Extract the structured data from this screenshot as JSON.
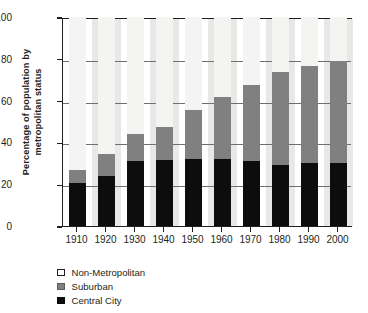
{
  "chart_data": {
    "type": "bar",
    "subtype": "stacked-bar-100",
    "title": "",
    "xlabel": "",
    "ylabel": "Percentage of population by metropolitan status",
    "ylim": [
      0,
      100
    ],
    "yticks": [
      0,
      20,
      40,
      60,
      80,
      100
    ],
    "grid": true,
    "legend_position": "below-left",
    "categories": [
      "1910",
      "1920",
      "1930",
      "1940",
      "1950",
      "1960",
      "1970",
      "1980",
      "1990",
      "2000"
    ],
    "series": [
      {
        "name": "Central City",
        "color": "#0d0d0d",
        "values": [
          20.5,
          24.0,
          31.0,
          31.5,
          32.0,
          32.0,
          31.0,
          29.0,
          30.0,
          30.0
        ]
      },
      {
        "name": "Suburban",
        "color": "#808080",
        "values": [
          6.5,
          10.5,
          13.0,
          16.0,
          23.5,
          29.5,
          36.5,
          44.5,
          46.5,
          49.0
        ]
      },
      {
        "name": "Non-Metropolitan",
        "color": "#f4f4f2",
        "values": [
          73.0,
          65.5,
          56.0,
          52.5,
          44.5,
          38.5,
          32.5,
          26.5,
          23.5,
          21.0
        ]
      }
    ],
    "cumulative_tops": {
      "central_city": [
        20.5,
        24.0,
        31.0,
        31.5,
        32.0,
        32.0,
        31.0,
        29.0,
        30.0,
        30.0
      ],
      "suburban": [
        27.0,
        34.5,
        44.0,
        47.5,
        55.5,
        61.5,
        67.5,
        73.5,
        76.5,
        79.0
      ],
      "total": [
        100,
        100,
        100,
        100,
        100,
        100,
        100,
        100,
        100,
        100
      ]
    }
  },
  "axis": {
    "y_title_line1": "Percentage of population by",
    "y_title_line2": "metropolitan status",
    "y_ticks": [
      "0",
      "20",
      "40",
      "60",
      "80",
      "100"
    ],
    "x_ticks": [
      "1910",
      "1920",
      "1930",
      "1940",
      "1950",
      "1960",
      "1970",
      "1980",
      "1990",
      "2000"
    ]
  },
  "legend": {
    "items": [
      {
        "label": "Non-Metropolitan",
        "color": "#ffffff"
      },
      {
        "label": "Suburban",
        "color": "#808080"
      },
      {
        "label": "Central City",
        "color": "#0d0d0d"
      }
    ]
  }
}
